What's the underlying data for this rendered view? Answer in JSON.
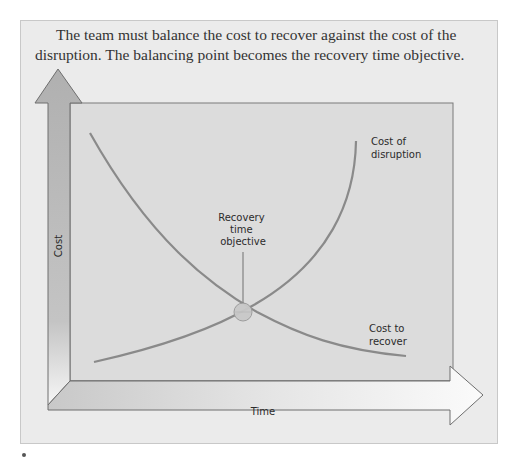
{
  "intro": {
    "text": "The team must balance the cost to recover against the cost of the disruption. The balancing point becomes the recovery time objective."
  },
  "diagram": {
    "y_axis_label": "Cost",
    "x_axis_label": "Time",
    "curves": [
      {
        "name": "Cost of disruption",
        "label_line1": "Cost of",
        "label_line2": "disruption",
        "trend": "increasing"
      },
      {
        "name": "Cost to recover",
        "label_line1": "Cost to",
        "label_line2": "recover",
        "trend": "decreasing"
      }
    ],
    "intersection": {
      "label_line1": "Recovery",
      "label_line2": "time",
      "label_line3": "objective"
    },
    "colors": {
      "panel_bg": "#ebebeb",
      "plot_bg": "#dcdcdc",
      "curve": "#8a8a8a",
      "axis_arrow_fill": "#b8b8b8",
      "axis_arrow_light": "#f4f4f4",
      "marker": "#c9c9c9"
    }
  }
}
